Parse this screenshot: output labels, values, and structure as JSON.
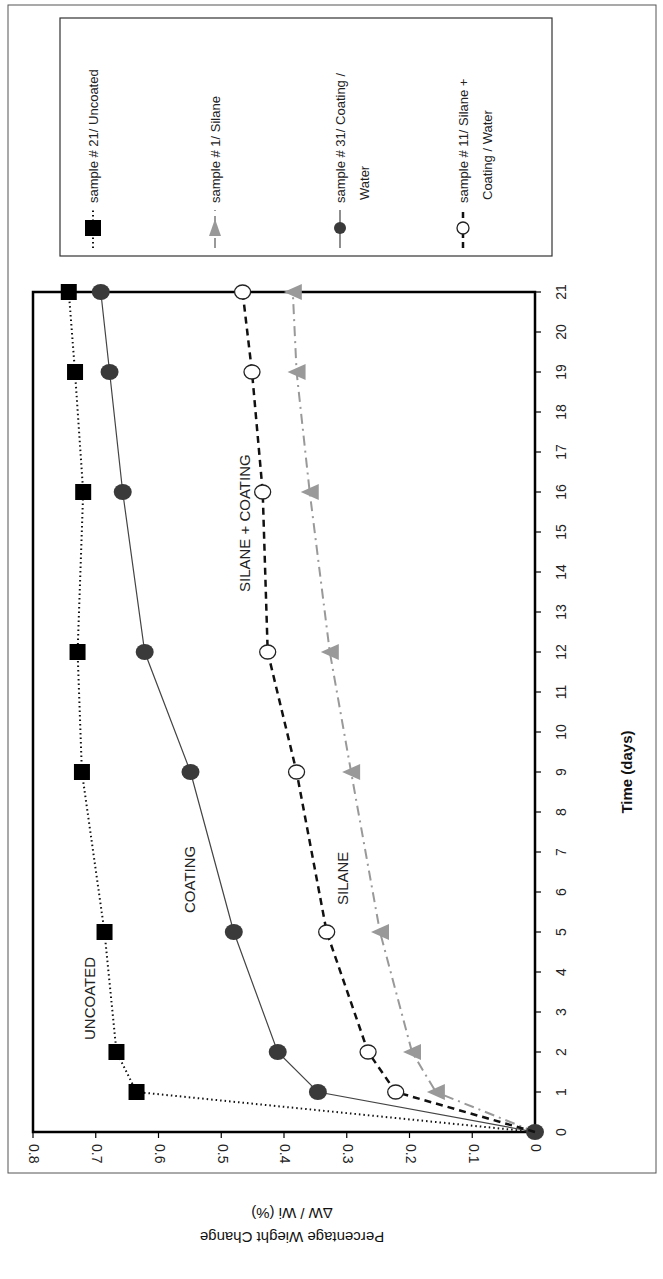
{
  "chart_data": {
    "type": "line",
    "orientation": "rotated 90deg clockwise (x-axis runs vertically on right, y-axis along bottom, upside down)",
    "title": "",
    "xlabel": "Time (days)",
    "ylabel": "Percentage Wieght Change",
    "ylabel_sub": "ΔW / Wi (%)",
    "xlim": [
      0,
      21
    ],
    "ylim": [
      0,
      0.8
    ],
    "x_ticks": [
      0,
      1,
      2,
      3,
      4,
      5,
      6,
      7,
      8,
      9,
      10,
      11,
      12,
      13,
      14,
      15,
      16,
      17,
      18,
      19,
      20,
      21
    ],
    "y_ticks": [
      "0",
      "0.1",
      "0.2",
      "0.3",
      "0.4",
      "0.5",
      "0.6",
      "0.7",
      "0.8"
    ],
    "grid": false,
    "legend_position": "top-right box",
    "series": [
      {
        "name": "sample # 21/ Uncoated",
        "marker": "filled-square",
        "line": "dotted",
        "color": "#111111",
        "x": [
          0,
          1,
          2,
          5,
          9,
          12,
          16,
          19,
          21
        ],
        "values": [
          0,
          0.635,
          0.667,
          0.686,
          0.722,
          0.729,
          0.72,
          0.733,
          0.743
        ]
      },
      {
        "name": "sample # 1/ Silane",
        "marker": "filled-triangle",
        "line": "dash-dot",
        "color": "#999999",
        "x": [
          0,
          1,
          2,
          5,
          9,
          12,
          16,
          19,
          21
        ],
        "values": [
          0,
          0.158,
          0.196,
          0.247,
          0.293,
          0.327,
          0.359,
          0.38,
          0.386
        ]
      },
      {
        "name": "sample # 31/ Coating / Water",
        "marker": "filled-circle",
        "line": "solid",
        "color": "#444444",
        "x": [
          0,
          1,
          2,
          5,
          9,
          12,
          16,
          19,
          21
        ],
        "values": [
          0,
          0.346,
          0.41,
          0.48,
          0.549,
          0.622,
          0.657,
          0.678,
          0.692
        ]
      },
      {
        "name": "sample # 11/ Silane + Coating / Water",
        "marker": "open-circle",
        "line": "dashed",
        "color": "#111111",
        "x": [
          0,
          1,
          2,
          5,
          9,
          12,
          16,
          19,
          21
        ],
        "values": [
          0,
          0.222,
          0.266,
          0.332,
          0.38,
          0.426,
          0.434,
          0.451,
          0.466
        ]
      }
    ],
    "annotations": [
      "UNCOATED",
      "COATING",
      "SILANE",
      "SILANE + COATING"
    ]
  },
  "legend": {
    "items": [
      {
        "line1": "sample # 21/ Uncoated",
        "line2": ""
      },
      {
        "line1": "sample # 1/ Silane",
        "line2": ""
      },
      {
        "line1": "sample # 31/ Coating /",
        "line2": "Water"
      },
      {
        "line1": "sample # 11/ Silane +",
        "line2": "Coating / Water"
      }
    ]
  },
  "labels": {
    "uncoated": "UNCOATED",
    "coating": "COATING",
    "silane": "SILANE",
    "silane_coating": "SILANE + COATING",
    "xlabel": "Time (days)",
    "ylabel": "Percentage Wieght Change",
    "ylabel_sub": "ΔW / Wi (%)"
  }
}
